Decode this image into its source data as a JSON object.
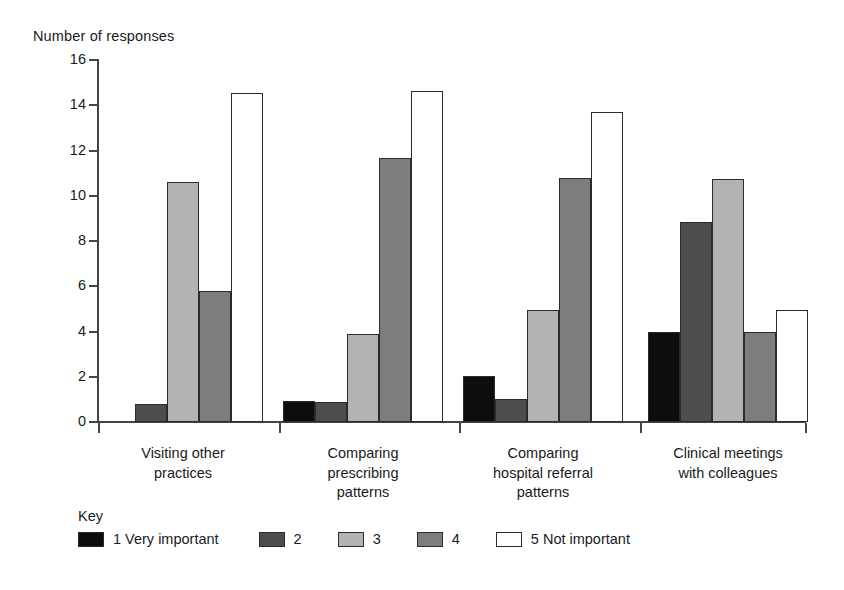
{
  "chart_data": {
    "type": "bar",
    "title": "",
    "ylabel": "Number of responses",
    "xlabel": "",
    "ylim": [
      0,
      16
    ],
    "yticks": [
      0,
      2,
      4,
      6,
      8,
      10,
      12,
      14,
      16
    ],
    "grid": false,
    "legend_position": "bottom-left",
    "legend_title": "Key",
    "categories": [
      "Visiting other\npractices",
      "Comparing\nprescribing\npatterns",
      "Comparing\nhospital referral\npatterns",
      "Clinical meetings\nwith colleagues"
    ],
    "series": [
      {
        "name": "1 Very important",
        "color": "#0d0d0d",
        "values": [
          0,
          0.95,
          2.05,
          4.0
        ]
      },
      {
        "name": "2",
        "color": "#4d4d4d",
        "values": [
          0.8,
          0.9,
          1.0,
          8.85
        ]
      },
      {
        "name": "3",
        "color": "#b3b3b3",
        "values": [
          10.6,
          3.9,
          4.95,
          10.75
        ]
      },
      {
        "name": "4",
        "color": "#7d7d7d",
        "values": [
          5.8,
          11.65,
          10.8,
          4.0
        ]
      },
      {
        "name": "5 Not important",
        "color": "#ffffff",
        "values": [
          14.55,
          14.65,
          13.7,
          4.95
        ]
      }
    ]
  },
  "axis": {
    "y_title": "Number of responses"
  },
  "key": {
    "title": "Key",
    "items": [
      {
        "label": "1 Very important",
        "color": "#0d0d0d"
      },
      {
        "label": "2",
        "color": "#4d4d4d"
      },
      {
        "label": "3",
        "color": "#b3b3b3"
      },
      {
        "label": "4",
        "color": "#7d7d7d"
      },
      {
        "label": "5 Not important",
        "color": "#ffffff"
      }
    ]
  }
}
